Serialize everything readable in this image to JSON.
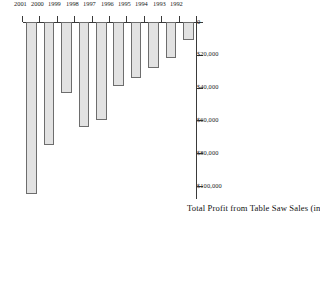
{
  "chart_data": {
    "type": "bar",
    "orientation": "horizontal",
    "title": "",
    "xlabel": "Total Profit from Table Saw Sales (in dollars)",
    "ylabel": "",
    "categories": [
      "1992",
      "1993",
      "1994",
      "1995",
      "1996",
      "1997",
      "1998",
      "1999",
      "2000",
      "2001"
    ],
    "values": [
      11000,
      22000,
      28000,
      34000,
      39000,
      60000,
      64000,
      43000,
      75000,
      105000
    ],
    "xlim": [
      0,
      110000
    ],
    "tick_values": [
      0,
      20000,
      40000,
      60000,
      80000,
      100000
    ],
    "tick_labels": [
      "0",
      "$20,000",
      "$40,000",
      "$60,000",
      "$80,000",
      "$100,000"
    ],
    "grid": false,
    "legend": null,
    "bar_fill_color": "#e2e2e2",
    "bar_edge_color": "#6d6d6d",
    "axis_color": "#3a3a3a"
  }
}
